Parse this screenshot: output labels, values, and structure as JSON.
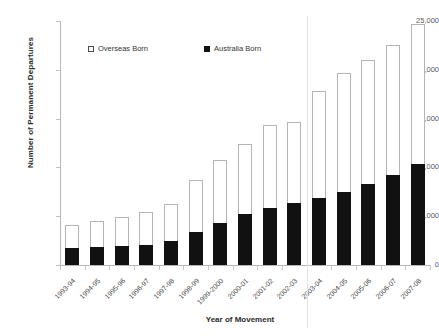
{
  "chart_data": {
    "type": "bar",
    "subtype": "stacked-bar",
    "title": "",
    "xlabel": "Year of Movement",
    "ylabel": "Number of Permanent Departures",
    "ylim": [
      0,
      25000
    ],
    "ytick_step": 5000,
    "ytick_labels": [
      "0",
      "5,000",
      "10,000",
      "15,000",
      "20,000",
      "25,000"
    ],
    "ytick_values": [
      0,
      5000,
      10000,
      15000,
      20000,
      25000
    ],
    "grid": false,
    "legend_position": "top-inside",
    "categories": [
      "1993-94",
      "1994-95",
      "1995-96",
      "1996-97",
      "1997-98",
      "1998-99",
      "1999-2000",
      "2000-01",
      "2001-02",
      "2002-03",
      "2003-04",
      "2004-05",
      "2005-06",
      "2006-07",
      "2007-08"
    ],
    "series": [
      {
        "name": "Australia Born",
        "color": "#111111",
        "values": [
          1750,
          1800,
          1900,
          2100,
          2450,
          3400,
          4300,
          5200,
          5850,
          6400,
          6900,
          7500,
          8350,
          9250,
          10300
        ]
      },
      {
        "name": "Overseas Born",
        "color": "#ffffff",
        "values": [
          2350,
          2700,
          3000,
          3300,
          3800,
          5300,
          6500,
          7250,
          8450,
          8300,
          10900,
          12200,
          12650,
          13250,
          14400
        ]
      }
    ],
    "totals": [
      4100,
      4500,
      4900,
      5400,
      6250,
      8700,
      10800,
      12450,
      14300,
      14700,
      17800,
      19700,
      21000,
      22500,
      24700
    ],
    "annotations": [
      {
        "name": "reference-line",
        "type": "vertical-line",
        "between": [
          "2002-03",
          "2003-04"
        ]
      }
    ]
  },
  "legend": {
    "items": [
      {
        "label": "Overseas Born",
        "swatch": "hollow-square"
      },
      {
        "label": "Australia Born",
        "swatch": "solid-square"
      }
    ]
  }
}
